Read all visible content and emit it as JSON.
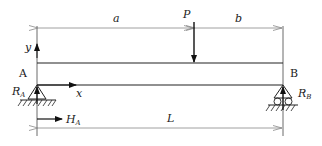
{
  "diagram": {
    "type": "simply-supported-beam",
    "labels": {
      "a": "a",
      "b": "b",
      "P": "P",
      "L": "L",
      "y": "y",
      "x": "x",
      "A": "A",
      "B": "B",
      "RA_main": "R",
      "RA_sub": "A",
      "RB_main": "R",
      "RB_sub": "B",
      "HA_main": "H",
      "HA_sub": "A"
    },
    "colors": {
      "line": "#222222",
      "dim_line": "#888888",
      "background": "#ffffff"
    }
  }
}
